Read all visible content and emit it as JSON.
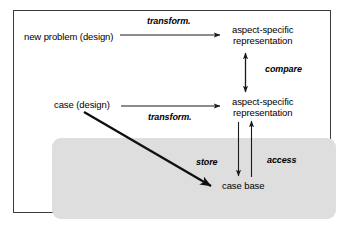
{
  "figure": {
    "frame_border_color": "#3a3a3a",
    "background_color": "#ffffff",
    "shaded_region_color": "#dedede"
  },
  "nodes": [
    {
      "id": "new-problem",
      "label": "new problem (design)",
      "lines": [
        "new problem (design)"
      ]
    },
    {
      "id": "aspect-top",
      "label": "aspect-specific representation",
      "lines": [
        "aspect-specific",
        "representation"
      ]
    },
    {
      "id": "case",
      "label": "case (design)",
      "lines": [
        "case (design)"
      ]
    },
    {
      "id": "aspect-bottom",
      "label": "aspect-specific representation",
      "lines": [
        "aspect-specific",
        "representation"
      ]
    },
    {
      "id": "case-base",
      "label": "case base",
      "lines": [
        "case base"
      ]
    }
  ],
  "edges": [
    {
      "id": "transform-top",
      "label": "transform.",
      "from": "new-problem",
      "to": "aspect-top",
      "style": "single-arrow-right"
    },
    {
      "id": "transform-bottom",
      "label": "transform.",
      "from": "case",
      "to": "aspect-bottom",
      "style": "single-arrow-right"
    },
    {
      "id": "compare",
      "label": "compare",
      "from": "aspect-bottom",
      "to": "aspect-top",
      "style": "double-arrow-vertical"
    },
    {
      "id": "store",
      "label": "store",
      "from": "aspect-bottom",
      "to": "case-base",
      "style": "single-arrow-down"
    },
    {
      "id": "access",
      "label": "access",
      "from": "case-base",
      "to": "aspect-bottom",
      "style": "single-arrow-up"
    },
    {
      "id": "store-diagonal",
      "label": "",
      "from": "case",
      "to": "case-base",
      "style": "thick-arrow-diagonal"
    }
  ],
  "node_text": {
    "new_problem": "new problem (design)",
    "aspect_top_line1": "aspect-specific",
    "aspect_top_line2": "representation",
    "case": "case (design)",
    "aspect_bottom_line1": "aspect-specific",
    "aspect_bottom_line2": "representation",
    "case_base": "case base"
  },
  "edge_text": {
    "transform_top": "transform.",
    "transform_bottom": "transform.",
    "compare": "compare",
    "store": "store",
    "access": "access"
  }
}
